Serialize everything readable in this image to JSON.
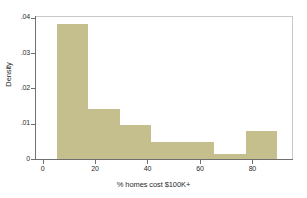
{
  "chart_data": {
    "type": "bar",
    "title": "",
    "subtitle": "",
    "xlabel": "% homes cost $100K+",
    "ylabel": "Density",
    "grid": false,
    "legend": "none",
    "xlim": [
      -2.5,
      95.5
    ],
    "ylim": [
      0,
      0.0405
    ],
    "x_ticks": [
      "0",
      "20",
      "40",
      "60",
      "80"
    ],
    "x_tick_values": [
      0,
      20,
      40,
      60,
      80
    ],
    "y_ticks": [
      ".04",
      ".03",
      ".02",
      ".01",
      "0"
    ],
    "y_tick_values": [
      0.04,
      0.03,
      0.02,
      0.01,
      0
    ],
    "bin_edges": [
      5.5,
      17.5,
      29.5,
      41.5,
      53.5,
      65.5,
      77.5,
      89.5
    ],
    "categories": [
      "5.5-17.5",
      "17.5-29.5",
      "29.5-41.5",
      "41.5-53.5",
      "53.5-65.5",
      "65.5-77.5",
      "77.5-89.5"
    ],
    "values": [
      0.0382,
      0.0142,
      0.0095,
      0.0047,
      0.0047,
      0.0013,
      0.0078
    ],
    "bars": [
      {
        "label": "bin-1",
        "x0": 5.5,
        "x1": 17.5,
        "density": 0.0382
      },
      {
        "label": "bin-2",
        "x0": 17.5,
        "x1": 29.5,
        "density": 0.0142
      },
      {
        "label": "bin-3",
        "x0": 29.5,
        "x1": 41.5,
        "density": 0.0095
      },
      {
        "label": "bin-4",
        "x0": 41.5,
        "x1": 53.5,
        "density": 0.0047
      },
      {
        "label": "bin-5",
        "x0": 53.5,
        "x1": 65.5,
        "density": 0.0047
      },
      {
        "label": "bin-6",
        "x0": 65.5,
        "x1": 77.5,
        "density": 0.0013
      },
      {
        "label": "bin-7",
        "x0": 77.5,
        "x1": 89.5,
        "density": 0.0078
      }
    ],
    "colors": {
      "bar_fill": "#c5bf8e",
      "axis": "#6f6f6f",
      "frame": "#c9c9c9",
      "text": "#2b2b2b",
      "background": "#ffffff"
    }
  }
}
